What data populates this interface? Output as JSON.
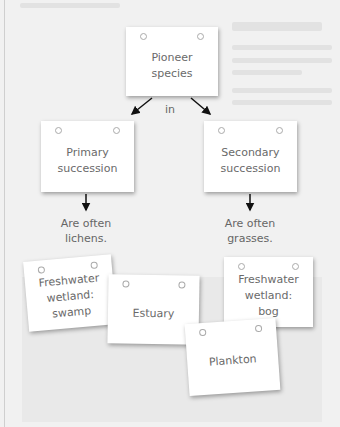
{
  "diagram": {
    "root": {
      "text_line1": "Pioneer",
      "text_line2": "species"
    },
    "connector_label": "in",
    "branches": [
      {
        "text_line1": "Primary",
        "text_line2": "succession",
        "caption_line1": "Are often",
        "caption_line2": "lichens."
      },
      {
        "text_line1": "Secondary",
        "text_line2": "succession",
        "caption_line1": "Are often",
        "caption_line2": "grasses."
      }
    ],
    "loose_cards": [
      {
        "line1": "Freshwater",
        "line2": "wetland:",
        "line3": "swamp"
      },
      {
        "line1": "Estuary"
      },
      {
        "line1": "Freshwater",
        "line2": "wetland:",
        "line3": "bog"
      },
      {
        "line1": "Plankton"
      }
    ]
  }
}
